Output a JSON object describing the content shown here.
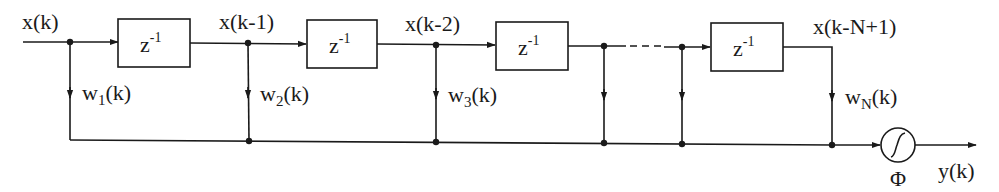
{
  "diagram": {
    "type": "tapped-delay-line neural filter",
    "input": {
      "label": "x(k)"
    },
    "delay_blocks": [
      {
        "base": "z",
        "exp": "-1"
      },
      {
        "base": "z",
        "exp": "-1"
      },
      {
        "base": "z",
        "exp": "-1"
      },
      {
        "base": "z",
        "exp": "-1"
      }
    ],
    "tap_signals": [
      {
        "label": "x(k-1)"
      },
      {
        "label": "x(k-2)"
      },
      {
        "label": "x(k-N+1)"
      }
    ],
    "weights": [
      {
        "base": "w",
        "sub": "1",
        "suffix": "(k)"
      },
      {
        "base": "w",
        "sub": "2",
        "suffix": "(k)"
      },
      {
        "base": "w",
        "sub": "3",
        "suffix": "(k)"
      },
      {
        "base": "w",
        "sub": "N",
        "suffix": "(k)"
      }
    ],
    "nonlinearity": {
      "label": "Φ",
      "symbol": "sigmoid"
    },
    "output": {
      "label": "y(k)"
    },
    "colors": {
      "ink": "#1a1a1a",
      "background": "#ffffff"
    }
  }
}
